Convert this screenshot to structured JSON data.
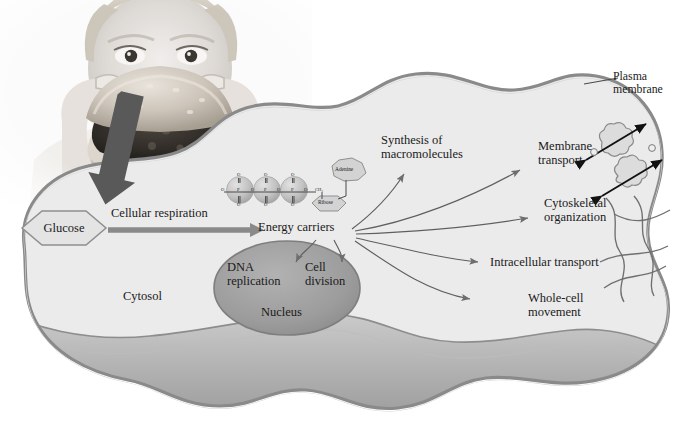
{
  "figure": {
    "type": "biology-cell-diagram",
    "photo_caption_alt": "Grayscale photograph of a person eating a hamburger"
  },
  "labels": {
    "plasma_membrane": "Plasma\nmembrane",
    "glucose": "Glucose",
    "cellular_respiration": "Cellular respiration",
    "energy_carriers": "Energy carriers",
    "cytosol": "Cytosol",
    "nucleus": "Nucleus",
    "dna_replication": "DNA\nreplication",
    "cell_division": "Cell\ndivision",
    "synthesis_of_macromolecules": "Synthesis of\nmacromolecules",
    "membrane_transport": "Membrane\ntransport",
    "cytoskeletal_organization": "Cytoskeletal\norganization",
    "intracellular_transport": "Intracellular transport",
    "whole_cell_movement": "Whole-cell\nmovement"
  },
  "molecule": {
    "name": "ATP energy carrier",
    "adenine": "Adenine",
    "ribose": "Ribose",
    "phosphate_chain": [
      "O",
      "P",
      "O",
      "P",
      "O",
      "P",
      "O",
      "CH₂"
    ],
    "phosphate_top_labels": [
      "O",
      "O",
      "O"
    ],
    "phosphate_bottom_labels": [
      "O",
      "O",
      "O"
    ],
    "phosphate_count": 3
  },
  "processes": [
    "Synthesis of macromolecules",
    "Membrane transport",
    "Cytoskeletal organization",
    "Intracellular transport",
    "Whole-cell movement",
    "DNA replication",
    "Cell division"
  ],
  "colors": {
    "background": "#ffffff",
    "cytosol_fill": "#ebebeb",
    "membrane_band": "#a8a8a8",
    "membrane_stroke": "#8a8a8a",
    "nucleus_fill": "#9e9e9e",
    "nucleus_stroke": "#7e7e7e",
    "arrow_gray": "#6e6e6e",
    "big_arrow": "#595959",
    "text": "#1a1a1a",
    "molecule_fill": "#c9c9c9",
    "transport_arrow": "#111111"
  }
}
